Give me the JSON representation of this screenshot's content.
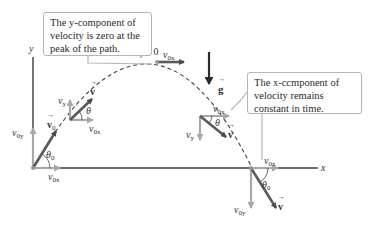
{
  "figure": {
    "type": "projectile-motion-diagram",
    "axes": {
      "x_label": "x",
      "y_label": "y"
    },
    "gravity": {
      "label": "g",
      "vector": true,
      "direction": "down"
    },
    "callouts": [
      {
        "id": "y-component",
        "lines": [
          "The y-component of",
          "velocity is zero at the",
          "peak of the path."
        ],
        "italic_word": "y"
      },
      {
        "id": "x-component",
        "lines": [
          "The x-ccmponent of",
          "velocity remains",
          "constant in time."
        ],
        "italic_word": "x"
      }
    ],
    "points": [
      {
        "id": "launch",
        "vectors": [
          {
            "name": "v0",
            "label": "v",
            "subscript": "0",
            "vector": true
          },
          {
            "name": "v0y",
            "label": "v",
            "subscript": "0y"
          },
          {
            "name": "v0x",
            "label": "v",
            "subscript": "0x"
          }
        ],
        "angle": {
          "label": "θ",
          "subscript": "0"
        }
      },
      {
        "id": "rising",
        "vectors": [
          {
            "name": "v",
            "label": "v",
            "vector": true
          },
          {
            "name": "vy",
            "label": "v",
            "subscript": "y"
          },
          {
            "name": "v0x",
            "label": "v",
            "subscript": "0x"
          }
        ],
        "angle": {
          "label": "θ"
        }
      },
      {
        "id": "peak",
        "annotation": "vy = 0",
        "vy_label": "v",
        "vy_sub": "y",
        "vy_value": "= 0",
        "vectors": [
          {
            "name": "v0x",
            "label": "v",
            "subscript": "0x"
          }
        ]
      },
      {
        "id": "falling",
        "vectors": [
          {
            "name": "v0x",
            "label": "v",
            "subscript": "0x"
          },
          {
            "name": "vy",
            "label": "v",
            "subscript": "y"
          },
          {
            "name": "v",
            "label": "v",
            "vector": true
          }
        ],
        "angle": {
          "label": "θ"
        }
      },
      {
        "id": "landing",
        "vectors": [
          {
            "name": "v0x",
            "label": "v",
            "subscript": "0x"
          },
          {
            "name": "v0y",
            "label": "v",
            "subscript": "0y"
          },
          {
            "name": "v",
            "label": "v",
            "vector": true
          }
        ],
        "angle": {
          "label": "θ",
          "subscript": "0"
        }
      }
    ],
    "colors": {
      "axis": "#3a3a3a",
      "velocity_vector": "#5a5a5a",
      "component_vector": "#a8a8a8",
      "path": "#444444",
      "callout_border": "#b5b5b5",
      "text": "#333333"
    }
  }
}
